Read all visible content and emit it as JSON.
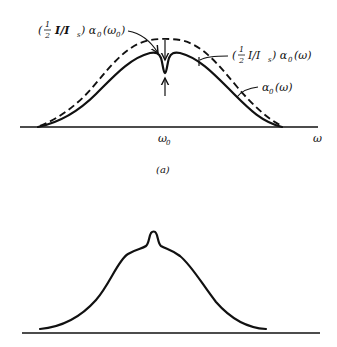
{
  "figure": {
    "panel_a": {
      "caption": "(a)",
      "x_axis_label": "ω",
      "center_tick_label": "ω",
      "center_tick_subscript": "0",
      "annotations": {
        "saturated_dip": {
          "prefix": "(",
          "frac_num": "1",
          "frac_den": "2",
          "middle": "I/I",
          "middle_sub": "s",
          "suffix": ") α",
          "suffix_sub": "0",
          "arg": "(ω",
          "arg_sub": "0",
          "arg_close": ")"
        },
        "dashed_curve": {
          "prefix": "(",
          "frac_num": "1",
          "frac_den": "2",
          "middle": "I/I",
          "middle_sub": "s",
          "suffix": ") α",
          "suffix_sub": "0",
          "arg": "(ω)"
        },
        "solid_curve": {
          "main": "α",
          "sub": "0",
          "arg": "(ω)"
        }
      },
      "curves": [
        {
          "name": "unsaturated gain profile",
          "style": "dashed"
        },
        {
          "name": "saturated gain profile with hole at ω0",
          "style": "solid"
        }
      ]
    },
    "panel_b": {
      "curves": [
        {
          "name": "profile with central peak (Lamb dip inverse)",
          "style": "solid"
        }
      ]
    }
  }
}
